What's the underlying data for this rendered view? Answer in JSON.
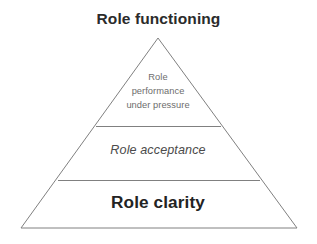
{
  "figure": {
    "title": "Role functioning",
    "background_color": "#ffffff",
    "width": 317,
    "height": 244
  },
  "diagram": {
    "type": "pyramid",
    "shape": "triangle",
    "outline_color": "#808080",
    "outline_width": 1,
    "fill_color": "#ffffff",
    "apex": {
      "x": 158,
      "y": 38
    },
    "base_left": {
      "x": 21,
      "y": 228
    },
    "base_right": {
      "x": 297,
      "y": 228
    },
    "dividers": [
      {
        "y": 126,
        "x1": 96,
        "x2": 221
      },
      {
        "y": 180,
        "x1": 58,
        "x2": 260
      }
    ],
    "tiers": [
      {
        "position": "top",
        "level": 1,
        "label": "Role performance under pressure",
        "lines": [
          "Role",
          "performance",
          "under pressure"
        ],
        "text_color": "#6d6d6d",
        "emphasis": "regular"
      },
      {
        "position": "middle",
        "level": 2,
        "label": "Role acceptance",
        "lines": [
          "Role acceptance"
        ],
        "text_color": "#4b4b4b",
        "emphasis": "italic"
      },
      {
        "position": "bottom",
        "level": 3,
        "label": "Role clarity",
        "lines": [
          "Role clarity"
        ],
        "text_color": "#232323",
        "emphasis": "bold"
      }
    ]
  }
}
